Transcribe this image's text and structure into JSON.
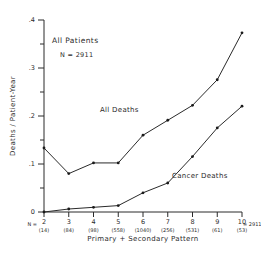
{
  "chart_data": {
    "type": "line",
    "title": "",
    "xlabel": "Primary + Secondary  Pattern",
    "ylabel": "Deaths / Patient-Year",
    "x": [
      2,
      3,
      4,
      5,
      6,
      7,
      8,
      9,
      10
    ],
    "xtick_labels": [
      "2",
      "3",
      "4",
      "5",
      "6",
      "7",
      "8",
      "9",
      "10"
    ],
    "ytick_labels": [
      "0",
      ".1",
      ".2",
      ".3",
      ".4"
    ],
    "ytick_values": [
      0,
      0.1,
      0.2,
      0.3,
      0.4
    ],
    "xlim": [
      2,
      10
    ],
    "ylim": [
      0,
      0.45
    ],
    "grid": false,
    "legend_position": "inline-annotation",
    "series": [
      {
        "name": "All Deaths",
        "values": [
          0.15,
          0.09,
          0.115,
          0.115,
          0.18,
          0.215,
          0.25,
          0.31,
          0.42
        ]
      },
      {
        "name": "Cancer Deaths",
        "values": [
          0.0,
          0.007,
          0.011,
          0.015,
          0.045,
          0.068,
          0.13,
          0.197,
          0.248
        ]
      }
    ],
    "group_counts": [
      "(14)",
      "(84)",
      "(98)",
      "(558)",
      "(1040)",
      "(256)",
      "(531)",
      "(61)",
      "(53)"
    ],
    "counts_prefix": "N =",
    "counts_total": "= 2911",
    "annotations": {
      "all_patients": "All Patients",
      "n_total": "N = 2911"
    },
    "colors": {
      "line": "#2a2a2a",
      "marker": "#1a1a1a",
      "text": "#2b2b2b",
      "background": "#ffffff"
    }
  }
}
